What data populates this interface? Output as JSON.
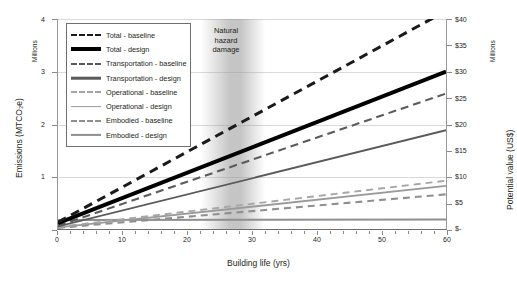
{
  "chart_data": {
    "type": "line",
    "title": "",
    "xlabel": "Building life (yrs)",
    "ylabel": "Emissions (MTCO₂e)",
    "ylabel_right": "Potential value (US$)",
    "yunits_left": "Millions",
    "yunits_right": "Millions",
    "xlim": [
      0,
      60
    ],
    "ylim": [
      0,
      4
    ],
    "ylim_right": [
      0,
      40
    ],
    "grid": true,
    "legend_position": "top-left inside",
    "xticks": [
      0,
      10,
      20,
      30,
      40,
      50,
      60
    ],
    "xticklabels": [
      "0",
      "10",
      "20",
      "30",
      "40",
      "50",
      "60"
    ],
    "xminortick_step": 2,
    "yticks_left": [
      0,
      1,
      2,
      3,
      4
    ],
    "yticklabels_left": [
      "",
      "1",
      "2",
      "3",
      "4"
    ],
    "yticks_right": [
      0,
      5,
      10,
      15,
      20,
      25,
      30,
      35,
      40
    ],
    "yticklabels_right": [
      "$-",
      "$5",
      "$10",
      "$15",
      "$20",
      "$25",
      "$30",
      "$35",
      "$40"
    ],
    "annotations": [
      {
        "text": "Natural\nhazard\ndamage",
        "x_start": 24,
        "x_end": 31,
        "style": "vertical gray gradient band"
      }
    ],
    "series": [
      {
        "name": "Total - baseline",
        "style": "dashed",
        "color": "#1a1a1a",
        "width": 2.4,
        "x": [
          0,
          60
        ],
        "values": [
          0.13,
          4.15
        ]
      },
      {
        "name": "Total - design",
        "style": "solid",
        "color": "#000000",
        "width": 3.2,
        "x": [
          0,
          60
        ],
        "values": [
          0.11,
          3.0
        ]
      },
      {
        "name": "Transportation - baseline",
        "style": "dashed",
        "color": "#5a5a5a",
        "width": 1.7,
        "x": [
          0,
          60
        ],
        "values": [
          0.06,
          2.58
        ]
      },
      {
        "name": "Transportation - design",
        "style": "solid",
        "color": "#5a5a5a",
        "width": 1.5,
        "x": [
          0,
          60
        ],
        "values": [
          0.05,
          1.88
        ]
      },
      {
        "name": "Operational - baseline",
        "style": "dashed",
        "color": "#a6a6a6",
        "width": 1.5,
        "x": [
          0,
          60
        ],
        "values": [
          0.04,
          0.92
        ]
      },
      {
        "name": "Operational - design",
        "style": "solid",
        "color": "#9a9a9a",
        "width": 1.5,
        "x": [
          0,
          60
        ],
        "values": [
          0.03,
          0.82
        ]
      },
      {
        "name": "Embodied - baseline",
        "style": "dashed",
        "color": "#8f8f8f",
        "width": 1.6,
        "x": [
          0,
          60
        ],
        "values": [
          0.02,
          0.66
        ]
      },
      {
        "name": "Embodied - design",
        "style": "solid",
        "color": "#8f8f8f",
        "width": 1.6,
        "x": [
          0,
          60
        ],
        "values": [
          0.17,
          0.18
        ]
      }
    ]
  },
  "legend": {
    "entries": [
      {
        "label": "Total - baseline"
      },
      {
        "label": "Total - design"
      },
      {
        "label": "Transportation - baseline"
      },
      {
        "label": "Transportation - design"
      },
      {
        "label": "Operational - baseline"
      },
      {
        "label": "Operational - design"
      },
      {
        "label": "Embodied - baseline"
      },
      {
        "label": "Embodied - design"
      }
    ]
  },
  "colors": {
    "total": "#000000",
    "transportation": "#5a5a5a",
    "operational": "#9a9a9a",
    "embodied": "#8f8f8f",
    "grid": "#d9d9d9",
    "axis": "#6f6f6f",
    "band": "#969696"
  }
}
